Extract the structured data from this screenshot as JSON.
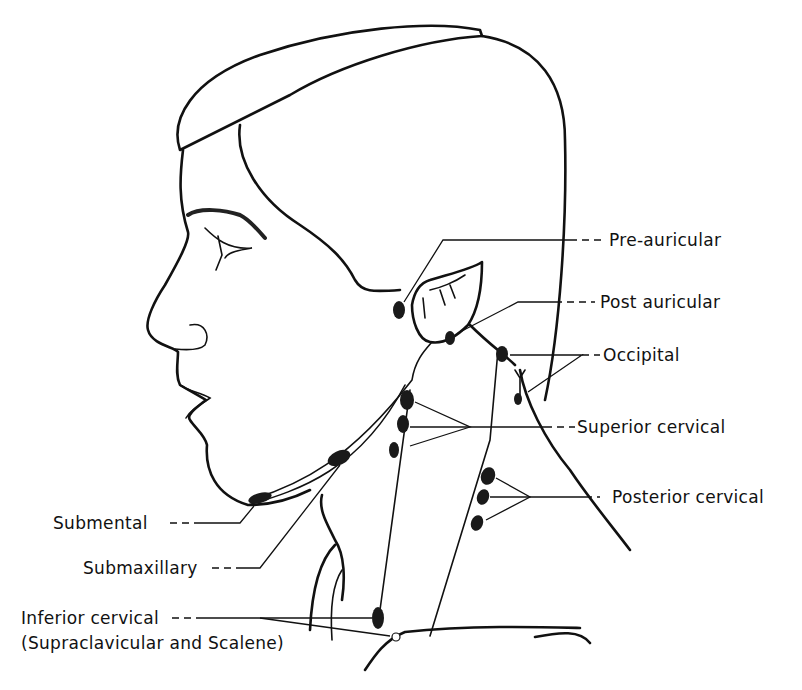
{
  "figure": {
    "labels": {
      "pre_auricular": "Pre-auricular",
      "post_auricular": "Post auricular",
      "occipital": "Occipital",
      "superior_cervical": "Superior cervical",
      "posterior_cervical": "Posterior cervical",
      "submental": "Submental",
      "submaxillary": "Submaxillary",
      "inferior_cervical": "Inferior cervical",
      "inferior_cervical_sub": "(Supraclavicular and Scalene)"
    },
    "colors": {
      "ink": "#111111",
      "node_fill": "#1a1a1a",
      "background": "#ffffff"
    }
  }
}
